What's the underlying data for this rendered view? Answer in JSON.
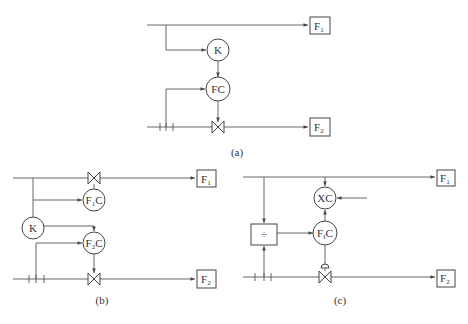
{
  "panels": {
    "a": {
      "caption": "(a)",
      "ratio_block": "K",
      "controller": "FC",
      "output_top": {
        "main": "F",
        "sub": "1"
      },
      "output_bottom": {
        "main": "F",
        "sub": "2"
      }
    },
    "b": {
      "caption": "(b)",
      "ratio_block": "K",
      "controller_top": {
        "main": "F",
        "sub": "1",
        "suffix": "C"
      },
      "controller_bottom": {
        "main": "F",
        "sub": "2",
        "suffix": "C"
      },
      "output_top": {
        "main": "F",
        "sub": "1"
      },
      "output_bottom": {
        "main": "F",
        "sub": "2"
      }
    },
    "c": {
      "caption": "(c)",
      "divider": "÷",
      "outer_controller": "XC",
      "inner_controller": {
        "main": "F",
        "sub": "f",
        "suffix": "C"
      },
      "output_top": {
        "main": "F",
        "sub": "1"
      },
      "output_bottom": {
        "main": "F",
        "sub": "2"
      }
    }
  }
}
